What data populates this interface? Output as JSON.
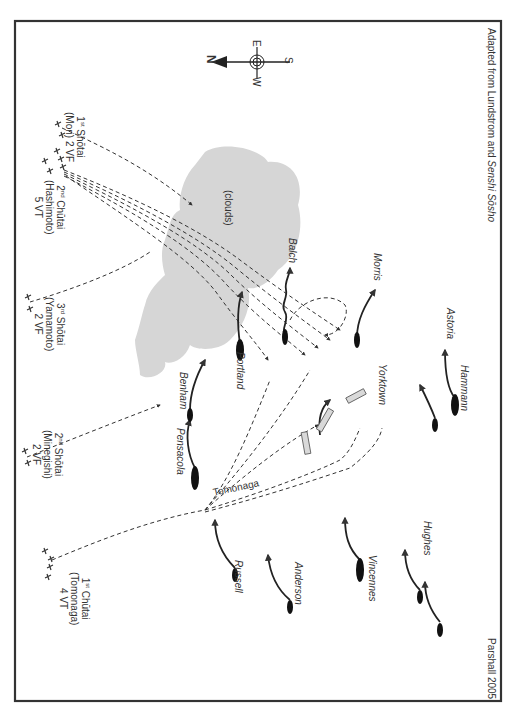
{
  "map": {
    "credit": "Parshall 2005",
    "source_prefix": "Adapted from Lundstrom and ",
    "source_italic": "Senshi Sōsho",
    "compass": {
      "n": "N",
      "e": "E",
      "s": "S",
      "w": "W"
    },
    "clouds_label": "(clouds)",
    "track_label": "Tomonaga",
    "groups": [
      {
        "ord": "1",
        "sup": "st",
        "unit": "Shōtai",
        "leader": "(Mori) 2 VF",
        "line3": ""
      },
      {
        "ord": "2",
        "sup": "nd",
        "unit": "Chūtai",
        "leader": "(Hashimoto)",
        "line3": "5 VT"
      },
      {
        "ord": "3",
        "sup": "rd",
        "unit": "Shōtai",
        "leader": "(Yamamoto)",
        "line3": "2 VF"
      },
      {
        "ord": "2",
        "sup": "nd",
        "unit": "Shōtai",
        "leader": "(Minegishi)",
        "line3": "2 VF"
      },
      {
        "ord": "1",
        "sup": "st",
        "unit": "Chūtai",
        "leader": "(Tomonaga)",
        "line3": "4 VT"
      }
    ],
    "ships": [
      "Balch",
      "Morris",
      "Portland",
      "Benham",
      "Yorktown",
      "Astoria",
      "Hammann",
      "Pensacola",
      "Russell",
      "Anderson",
      "Vincennes",
      "Hughes"
    ],
    "colors": {
      "frame": "#333333",
      "cloud": "#d6d6d6",
      "ink": "#222222",
      "text": "#333333",
      "ship_box": "#d9d9d9"
    }
  }
}
